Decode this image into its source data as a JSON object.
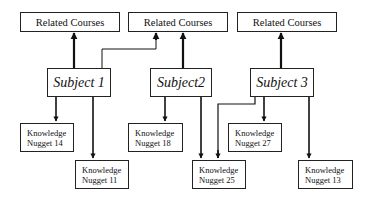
{
  "diagram": {
    "courses": [
      {
        "label": "Related Courses"
      },
      {
        "label": "Related Courses"
      },
      {
        "label": "Related Courses"
      }
    ],
    "subjects": [
      {
        "label": "Subject 1"
      },
      {
        "label": "Subject2"
      },
      {
        "label": "Subject 3"
      }
    ],
    "nuggets": [
      {
        "line1": "Knowledge",
        "line2": "Nugget 14"
      },
      {
        "line1": "Knowledge",
        "line2": "Nugget 11"
      },
      {
        "line1": "Knowledge",
        "line2": "Nugget 18"
      },
      {
        "line1": "Knowledge",
        "line2": "Nugget 25"
      },
      {
        "line1": "Knowledge",
        "line2": "Nugget 27"
      },
      {
        "line1": "Knowledge",
        "line2": "Nugget 13"
      }
    ],
    "edges": [
      {
        "from": "Subject 1",
        "to": "Related Courses 1"
      },
      {
        "from": "Subject 1",
        "to": "Related Courses 2"
      },
      {
        "from": "Subject2",
        "to": "Related Courses 2"
      },
      {
        "from": "Subject 3",
        "to": "Related Courses 3"
      },
      {
        "from": "Subject 1",
        "to": "Knowledge Nugget 14"
      },
      {
        "from": "Subject 1",
        "to": "Knowledge Nugget 11"
      },
      {
        "from": "Subject2",
        "to": "Knowledge Nugget 18"
      },
      {
        "from": "Subject2",
        "to": "Knowledge Nugget 25"
      },
      {
        "from": "Subject 3",
        "to": "Knowledge Nugget 25"
      },
      {
        "from": "Subject 3",
        "to": "Knowledge Nugget 27"
      },
      {
        "from": "Subject 3",
        "to": "Knowledge Nugget 13"
      }
    ]
  }
}
